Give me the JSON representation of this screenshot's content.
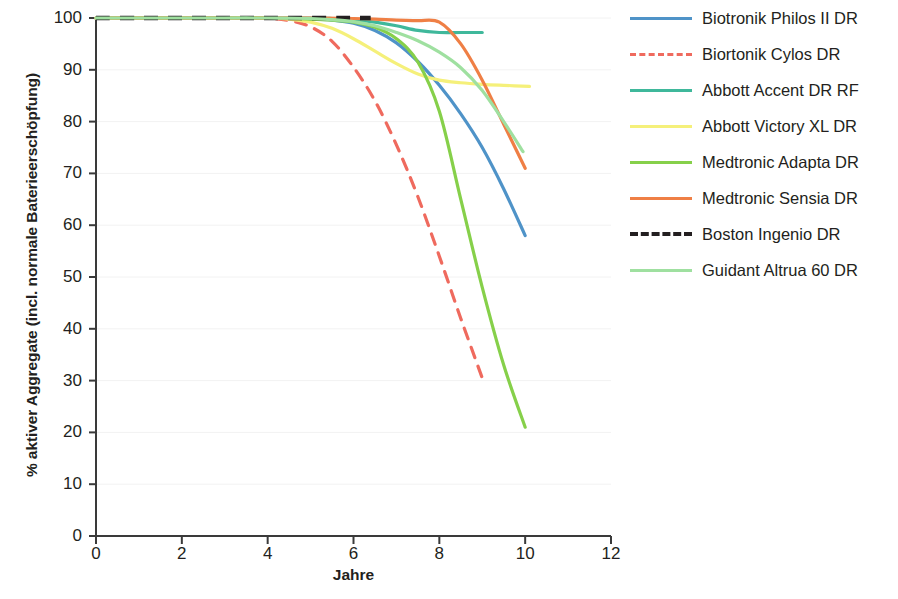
{
  "chart_data": {
    "type": "line",
    "title": "",
    "xlabel": "Jahre",
    "ylabel": "% aktiver Aggregate (incl. normale Baterieerschöpfung)",
    "xlim": [
      0,
      12
    ],
    "ylim": [
      0,
      100
    ],
    "xticks": [
      0,
      2,
      4,
      6,
      8,
      10,
      12
    ],
    "yticks": [
      0,
      10,
      20,
      30,
      40,
      50,
      60,
      70,
      80,
      90,
      100
    ],
    "grid": "faint-horizontal",
    "legend_position": "right",
    "series": [
      {
        "name": "Biotronik Philos II DR",
        "color": "#4f93c8",
        "style": "solid",
        "x": [
          0,
          1,
          2,
          3,
          4,
          5,
          5.5,
          6,
          6.5,
          7,
          7.5,
          8,
          8.5,
          9,
          9.5,
          10
        ],
        "y": [
          100,
          100,
          100,
          100,
          100,
          99.8,
          99.6,
          99.0,
          97.6,
          95.2,
          91.6,
          87.0,
          81.5,
          75.0,
          67.0,
          58.0
        ]
      },
      {
        "name": "Biortonik Cylos DR",
        "color": "#ef6a5e",
        "style": "dashed",
        "x": [
          0,
          1,
          2,
          3,
          4,
          4.5,
          5,
          5.5,
          6,
          6.5,
          7,
          7.5,
          8,
          8.5,
          9
        ],
        "y": [
          100,
          100,
          100,
          100,
          99.9,
          99.5,
          98.3,
          95.5,
          90.5,
          84.0,
          75.5,
          65.5,
          54.0,
          42.0,
          30.5
        ]
      },
      {
        "name": "Abbott Accent DR RF",
        "color": "#3fb89b",
        "style": "solid",
        "x": [
          0,
          1,
          2,
          3,
          4,
          5,
          5.5,
          6,
          6.5,
          7,
          7.5,
          8,
          8.5,
          9
        ],
        "y": [
          100,
          100,
          100,
          100,
          100,
          100,
          99.9,
          99.7,
          99.2,
          98.5,
          97.6,
          97.2,
          97.2,
          97.2
        ]
      },
      {
        "name": "Abbott Victory XL DR",
        "color": "#f5f07a",
        "style": "solid",
        "x": [
          0,
          1,
          2,
          3,
          4,
          4.5,
          5,
          5.5,
          6,
          6.5,
          7,
          7.5,
          8,
          8.5,
          9,
          9.5,
          10.1
        ],
        "y": [
          100,
          100,
          100,
          100,
          100,
          99.8,
          99.2,
          98.0,
          96.0,
          93.6,
          91.2,
          89.2,
          88.0,
          87.5,
          87.2,
          87.0,
          86.8
        ]
      },
      {
        "name": "Medtronic Adapta DR",
        "color": "#86d04a",
        "style": "solid",
        "x": [
          0,
          1,
          2,
          3,
          4,
          5,
          5.5,
          6,
          6.5,
          7,
          7.5,
          8,
          8.5,
          9,
          9.5,
          10
        ],
        "y": [
          100,
          100,
          100,
          100,
          100,
          99.8,
          99.6,
          99.2,
          98.2,
          96.0,
          91.5,
          82.0,
          65.0,
          48.0,
          33.0,
          21.0
        ]
      },
      {
        "name": "Medtronic Sensia DR",
        "color": "#ef7f45",
        "style": "solid",
        "x": [
          0,
          1,
          2,
          3,
          4,
          5,
          6,
          6.5,
          7,
          7.5,
          8,
          8.5,
          9,
          9.5,
          10
        ],
        "y": [
          100,
          100,
          100,
          100,
          100,
          100,
          99.9,
          99.8,
          99.6,
          99.5,
          99.2,
          95.0,
          88.0,
          79.5,
          71.0
        ]
      },
      {
        "name": "Boston Ingenio DR",
        "color": "#231f20",
        "style": "dashed",
        "x": [
          0,
          1,
          2,
          3,
          4,
          5,
          5.8,
          6.4
        ],
        "y": [
          100,
          100,
          100,
          100,
          100,
          100,
          100,
          100
        ]
      },
      {
        "name": "Guidant Altrua 60 DR",
        "color": "#9fe0a0",
        "style": "solid",
        "x": [
          0,
          1,
          2,
          3,
          4,
          5,
          5.5,
          6,
          6.5,
          7,
          7.5,
          8,
          8.5,
          9,
          9.5,
          9.95
        ],
        "y": [
          100,
          100,
          100,
          100,
          100,
          99.9,
          99.7,
          99.3,
          98.5,
          97.2,
          95.6,
          93.4,
          90.4,
          86.0,
          80.0,
          74.2
        ]
      }
    ]
  },
  "axes": {
    "xlabel": "Jahre",
    "ylabel": "% aktiver Aggregate (incl. normale Baterieerschöpfung)",
    "xtick_labels": [
      "0",
      "2",
      "4",
      "6",
      "8",
      "10",
      "12"
    ],
    "ytick_labels": [
      "100",
      "90",
      "80",
      "70",
      "60",
      "50",
      "40",
      "30",
      "20",
      "10",
      "0"
    ]
  },
  "legend": {
    "items": [
      {
        "label": "Biotronik Philos II DR",
        "color": "#4f93c8",
        "style": "solid"
      },
      {
        "label": "Biortonik Cylos DR",
        "color": "#ef6a5e",
        "style": "dashed"
      },
      {
        "label": "Abbott Accent DR RF",
        "color": "#3fb89b",
        "style": "solid"
      },
      {
        "label": "Abbott Victory XL DR",
        "color": "#f5f07a",
        "style": "solid"
      },
      {
        "label": "Medtronic Adapta DR",
        "color": "#86d04a",
        "style": "solid"
      },
      {
        "label": "Medtronic Sensia DR",
        "color": "#ef7f45",
        "style": "solid"
      },
      {
        "label": "Boston Ingenio DR",
        "color": "#231f20",
        "style": "dashed"
      },
      {
        "label": "Guidant Altrua 60 DR",
        "color": "#9fe0a0",
        "style": "solid"
      }
    ]
  }
}
